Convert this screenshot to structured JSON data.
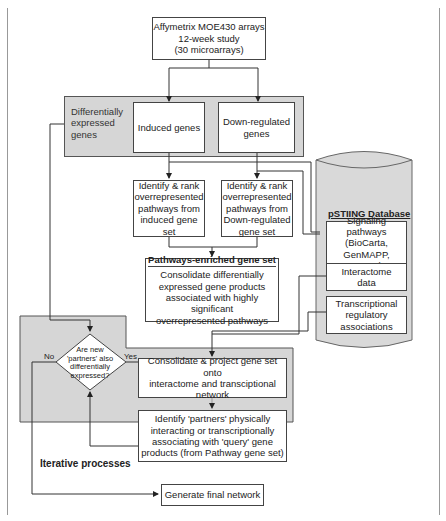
{
  "diagram": {
    "nodes": {
      "source": {
        "lines": [
          "Affymetrix MOE430 arrays",
          "12-week study",
          "(30 microarrays)"
        ]
      },
      "de_group_label": {
        "lines": [
          "Differentially",
          "expressed",
          "genes"
        ]
      },
      "induced": {
        "text": "Induced genes"
      },
      "downregulated": {
        "lines": [
          "Down-regulated",
          "genes"
        ]
      },
      "rank_induced": {
        "lines": [
          "Identify & rank",
          "overrepresented",
          "pathways from",
          "induced gene set"
        ]
      },
      "rank_down": {
        "lines": [
          "Identify & rank",
          "overrepresented",
          "pathways from",
          "Down-regulated",
          "gene set"
        ]
      },
      "enriched": {
        "title": "Pathways-enriched gene set",
        "lines": [
          "Consolidate differentially",
          "expressed gene products",
          "associated with highly significant",
          "overrepresented pathways"
        ]
      },
      "database": {
        "title": "pSTIING Database",
        "signaling": {
          "lines": [
            "Signaling",
            "pathways",
            "(BioCarta,",
            "GenMAPP, KEGG)"
          ]
        },
        "interactome": {
          "lines": [
            "Interactome",
            "data"
          ]
        },
        "transcriptional": {
          "lines": [
            "Transcriptional",
            "regulatory",
            "associations"
          ]
        }
      },
      "decision": {
        "lines": [
          "Are new",
          "'partners' also",
          "differentially",
          "expressed?"
        ],
        "no": "No",
        "yes": "Yes"
      },
      "project": {
        "lines": [
          "Consolidate & project gene set onto",
          "interactome and transciptional",
          "network"
        ]
      },
      "partners": {
        "lines": [
          "Identify 'partners' physically",
          "interacting or transcriptionally",
          "associating with 'query' gene",
          "products (from Pathway gene set)"
        ]
      },
      "iterative_label": {
        "text": "Iterative processes"
      },
      "final": {
        "text": "Generate final network"
      }
    },
    "colors": {
      "region_fill": "#d6d6d6",
      "database_fill": "#d9d9d9",
      "line": "#333333"
    }
  }
}
